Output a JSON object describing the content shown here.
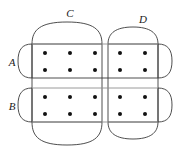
{
  "figure": {
    "kind": "set-diagram",
    "title": "",
    "canvas": {
      "width": 188,
      "height": 157
    },
    "colors": {
      "background": "#ffffff",
      "stroke": "#3a3a3a",
      "stroke_light": "#8f8f8f",
      "dot": "#111111",
      "label": "#1a1a1a"
    },
    "stroke_width": 0.9,
    "dot_radius": 2.0
  },
  "labels": {
    "a": "A",
    "b": "B",
    "c": "C",
    "d": "D"
  },
  "label_positions": {
    "a": {
      "x": 12,
      "y": 66
    },
    "b": {
      "x": 12,
      "y": 110
    },
    "c": {
      "x": 70,
      "y": 17
    },
    "d": {
      "x": 143,
      "y": 23
    }
  },
  "sets": [
    {
      "id": "A",
      "label": "A",
      "shape": "rounded-row",
      "orientation": "horizontal",
      "rect": {
        "x": 32,
        "y": 44,
        "width": 126,
        "height": 34
      },
      "cap_radius_x": 14,
      "members": 10
    },
    {
      "id": "B",
      "label": "B",
      "shape": "rounded-row",
      "orientation": "horizontal",
      "rect": {
        "x": 32,
        "y": 88,
        "width": 126,
        "height": 34
      },
      "cap_radius_x": 14,
      "members": 10
    },
    {
      "id": "C",
      "label": "C",
      "shape": "rounded-column",
      "orientation": "vertical",
      "rect": {
        "x": 32,
        "y": 44,
        "width": 70,
        "height": 78
      },
      "cap_radius_y": 23,
      "members": 12
    },
    {
      "id": "D",
      "label": "D",
      "shape": "rounded-column",
      "orientation": "vertical",
      "rect": {
        "x": 108,
        "y": 44,
        "width": 50,
        "height": 78
      },
      "cap_radius_y": 17,
      "members": 8
    }
  ],
  "dots": {
    "count": 20,
    "columns_x": [
      45,
      70,
      95,
      120,
      145
    ],
    "rows_y": [
      53,
      70,
      97,
      114
    ],
    "items": [
      {
        "x": 45,
        "y": 53,
        "sets": [
          "A",
          "C"
        ]
      },
      {
        "x": 70,
        "y": 53,
        "sets": [
          "A",
          "C"
        ]
      },
      {
        "x": 95,
        "y": 53,
        "sets": [
          "A",
          "C"
        ]
      },
      {
        "x": 120,
        "y": 53,
        "sets": [
          "A",
          "D"
        ]
      },
      {
        "x": 145,
        "y": 53,
        "sets": [
          "A",
          "D"
        ]
      },
      {
        "x": 45,
        "y": 70,
        "sets": [
          "A",
          "C"
        ]
      },
      {
        "x": 70,
        "y": 70,
        "sets": [
          "A",
          "C"
        ]
      },
      {
        "x": 95,
        "y": 70,
        "sets": [
          "A",
          "C"
        ]
      },
      {
        "x": 120,
        "y": 70,
        "sets": [
          "A",
          "D"
        ]
      },
      {
        "x": 145,
        "y": 70,
        "sets": [
          "A",
          "D"
        ]
      },
      {
        "x": 45,
        "y": 97,
        "sets": [
          "B",
          "C"
        ]
      },
      {
        "x": 70,
        "y": 97,
        "sets": [
          "B",
          "C"
        ]
      },
      {
        "x": 95,
        "y": 97,
        "sets": [
          "B",
          "C"
        ]
      },
      {
        "x": 120,
        "y": 97,
        "sets": [
          "B",
          "D"
        ]
      },
      {
        "x": 145,
        "y": 97,
        "sets": [
          "B",
          "D"
        ]
      },
      {
        "x": 45,
        "y": 114,
        "sets": [
          "B",
          "C"
        ]
      },
      {
        "x": 70,
        "y": 114,
        "sets": [
          "B",
          "C"
        ]
      },
      {
        "x": 95,
        "y": 114,
        "sets": [
          "B",
          "C"
        ]
      },
      {
        "x": 120,
        "y": 114,
        "sets": [
          "B",
          "D"
        ]
      },
      {
        "x": 145,
        "y": 114,
        "sets": [
          "B",
          "D"
        ]
      }
    ]
  }
}
